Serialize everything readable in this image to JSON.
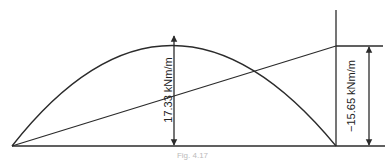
{
  "diagram": {
    "type": "bending-moment-diagram",
    "line_color": "#2b2b2b",
    "labels": {
      "midspan_moment": "17.33 kNm/m",
      "end_moment": "−15.65 kNm/m"
    },
    "caption": "Fig. 4.17"
  }
}
